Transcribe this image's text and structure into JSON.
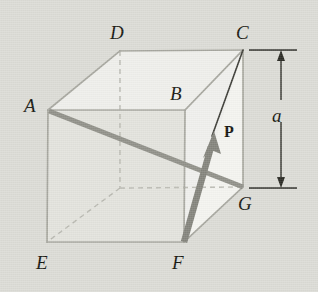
{
  "figure": {
    "type": "geometry-diagram",
    "background_color": "#dcdcd6",
    "labels": {
      "A": "A",
      "B": "B",
      "C": "C",
      "D": "D",
      "E": "E",
      "F": "F",
      "G": "G",
      "P": "P",
      "dimension": "a"
    },
    "vertices": {
      "A": {
        "x": 48,
        "y": 110,
        "label": "A",
        "label_x": 24,
        "label_y": 98,
        "hidden": false
      },
      "B": {
        "x": 185,
        "y": 110,
        "label": "B",
        "label_x": 170,
        "label_y": 86,
        "hidden": false
      },
      "C": {
        "x": 243,
        "y": 50,
        "label": "C",
        "label_x": 236,
        "label_y": 25,
        "hidden": false
      },
      "D": {
        "x": 120,
        "y": 51,
        "label": "D",
        "label_x": 110,
        "label_y": 25,
        "hidden": false
      },
      "E": {
        "x": 47,
        "y": 242,
        "label": "E",
        "label_x": 37,
        "label_y": 255,
        "hidden": false
      },
      "F": {
        "x": 184,
        "y": 242,
        "label": "F",
        "label_x": 172,
        "label_y": 255,
        "hidden": false
      },
      "G": {
        "x": 243,
        "y": 187,
        "label": "G",
        "label_x": 238,
        "label_y": 196,
        "hidden": false
      },
      "H": {
        "x": 120,
        "y": 188,
        "label": "",
        "label_x": 0,
        "label_y": 0,
        "hidden": true
      }
    },
    "edges_visible": [
      "A-B",
      "B-F",
      "F-E",
      "E-A",
      "A-D",
      "D-C",
      "C-G",
      "G-F",
      "B-C"
    ],
    "edges_hidden": [
      "D-H",
      "H-E",
      "H-G"
    ],
    "diagonal_line": {
      "name": "A-to-G-diagonal",
      "from": "A",
      "to": "G",
      "color": "#8e8e86",
      "width": 5
    },
    "vector": {
      "name": "force-P",
      "label": "P",
      "from": "F",
      "tip_x": 214,
      "tip_y": 133,
      "color": "#7d7d75",
      "width": 6,
      "label_x": 225,
      "label_y": 125
    },
    "thin_line": {
      "name": "P-to-C-line",
      "from_x": 214,
      "from_y": 133,
      "to": "C",
      "color": "#3a3a34",
      "width": 1.6
    },
    "shaded_triangle": {
      "name": "triangle-C-F-G",
      "points": "243,50 184,242 243,187",
      "fill": "#f2f2ee"
    },
    "faces": {
      "top": {
        "points": "48,110 120,51 243,50 185,110",
        "fill": "#eeeeea"
      },
      "front": {
        "points": "48,110 185,110 184,242 47,242",
        "fill": "#e2e2dc"
      },
      "right": {
        "points": "185,110 243,50 243,187 184,242",
        "fill": "#ebebe6"
      }
    },
    "dimension": {
      "name": "height-dimension-a",
      "label": "a",
      "label_x": 272,
      "label_y": 107,
      "top_y": 50,
      "bottom_y": 188,
      "arrow_x": 281,
      "ext_x_start": 248,
      "ext_x_end": 296,
      "color": "#2a2a24"
    }
  }
}
